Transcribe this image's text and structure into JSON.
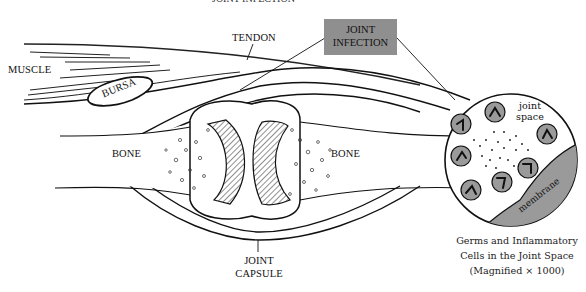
{
  "diagram": {
    "title_fragment": "JOINT INFECTION",
    "labels": {
      "muscle": "MUSCLE",
      "bursa": "BURSA",
      "tendon": "TENDON",
      "bone_left": "BONE",
      "bone_right": "BONE",
      "joint_capsule_line1": "JOINT",
      "joint_capsule_line2": "CAPSULE",
      "joint_infection_line1": "JOINT",
      "joint_infection_line2": "INFECTION"
    },
    "inset": {
      "joint_space_line1": "joint",
      "joint_space_line2": "space",
      "membrane": "membrane",
      "caption_line1": "Germs and Inflammatory",
      "caption_line2": "Cells in the Joint Space",
      "caption_line3": "(Magnified × 1000)"
    },
    "colors": {
      "callout_box": "#8f8f8f",
      "cell_fill": "#9a9a9a",
      "membrane_fill": "#9a9a9a",
      "line": "#111111"
    }
  }
}
